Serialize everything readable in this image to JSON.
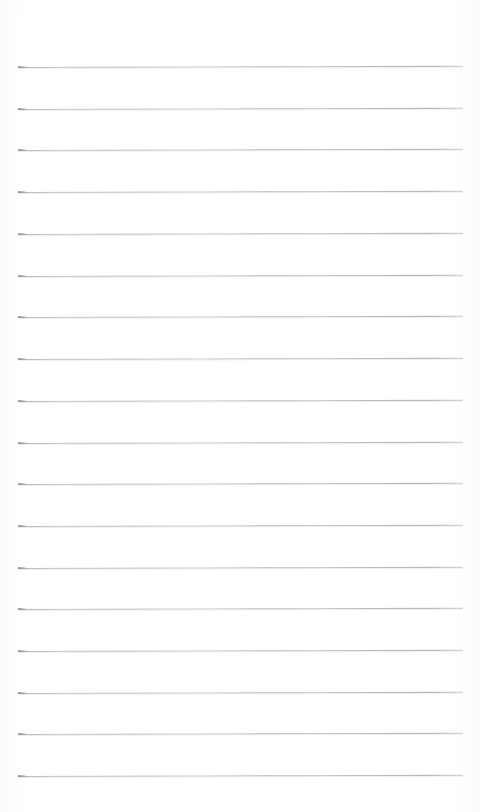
{
  "document": {
    "kind": "scanned-lined-notepad-page",
    "title": "Blank lined notepad page",
    "description": "Scan of an empty ruled notepad sheet with no handwriting or printed text.",
    "text_content": "",
    "page_width": 480,
    "page_height": 812,
    "background_color": "#ffffff",
    "paper_tone": "#fdfdfd"
  },
  "ruling": {
    "line_color": "#a8aaa9",
    "line_color_start_tick": "#8a8c8c",
    "line_thickness_px": 1,
    "line_count": 18,
    "line_left_x": 18,
    "line_right_x": 463,
    "line_length_px": 445,
    "first_line_y": 67,
    "line_spacing_px": 41.8,
    "tilt_degrees": -0.16,
    "top_margin_px": 67,
    "bottom_margin_px": 35,
    "left_margin_px": 18,
    "right_margin_px": 17,
    "lines": [
      {
        "index": 1,
        "y": 67,
        "left_x": 18,
        "right_x": 463
      },
      {
        "index": 2,
        "y": 109,
        "left_x": 18,
        "right_x": 463
      },
      {
        "index": 3,
        "y": 150,
        "left_x": 18,
        "right_x": 463
      },
      {
        "index": 4,
        "y": 192,
        "left_x": 18,
        "right_x": 463
      },
      {
        "index": 5,
        "y": 234,
        "left_x": 18,
        "right_x": 463
      },
      {
        "index": 6,
        "y": 276,
        "left_x": 18,
        "right_x": 463
      },
      {
        "index": 7,
        "y": 317,
        "left_x": 18,
        "right_x": 463
      },
      {
        "index": 8,
        "y": 359,
        "left_x": 18,
        "right_x": 463
      },
      {
        "index": 9,
        "y": 401,
        "left_x": 18,
        "right_x": 463
      },
      {
        "index": 10,
        "y": 443,
        "left_x": 18,
        "right_x": 463
      },
      {
        "index": 11,
        "y": 484,
        "left_x": 18,
        "right_x": 463
      },
      {
        "index": 12,
        "y": 526,
        "left_x": 18,
        "right_x": 463
      },
      {
        "index": 13,
        "y": 568,
        "left_x": 18,
        "right_x": 463
      },
      {
        "index": 14,
        "y": 609,
        "left_x": 18,
        "right_x": 463
      },
      {
        "index": 15,
        "y": 651,
        "left_x": 18,
        "right_x": 463
      },
      {
        "index": 16,
        "y": 693,
        "left_x": 18,
        "right_x": 463
      },
      {
        "index": 17,
        "y": 734,
        "left_x": 18,
        "right_x": 463
      },
      {
        "index": 18,
        "y": 776,
        "left_x": 18,
        "right_x": 463
      }
    ]
  }
}
